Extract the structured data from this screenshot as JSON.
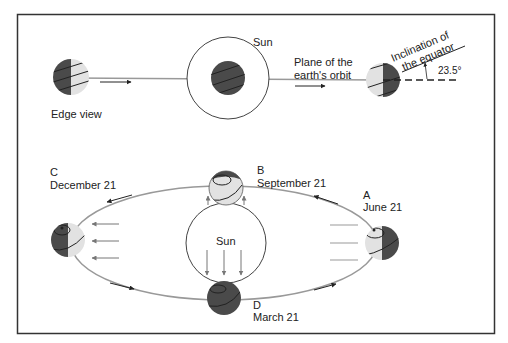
{
  "diagram": {
    "top_panel": {
      "edge_view_label": "Edge view",
      "sun_label": "Sun",
      "orbit_plane_label_line1": "Plane of the",
      "orbit_plane_label_line2": "earth's orbit",
      "inclination_label_line1": "Inclination of",
      "inclination_label_line2": "the equator",
      "angle_label": "23.5°"
    },
    "bottom_panel": {
      "sun_label": "Sun",
      "positions": [
        {
          "letter": "A",
          "date": "June 21"
        },
        {
          "letter": "B",
          "date": "September 21"
        },
        {
          "letter": "C",
          "date": "December 21"
        },
        {
          "letter": "D",
          "date": "March 21"
        }
      ]
    },
    "colors": {
      "dark_shade": "#4a4a4a",
      "light_shade": "#e2e2e2",
      "line": "#888888",
      "frame": "#333333",
      "text": "#222222"
    }
  }
}
